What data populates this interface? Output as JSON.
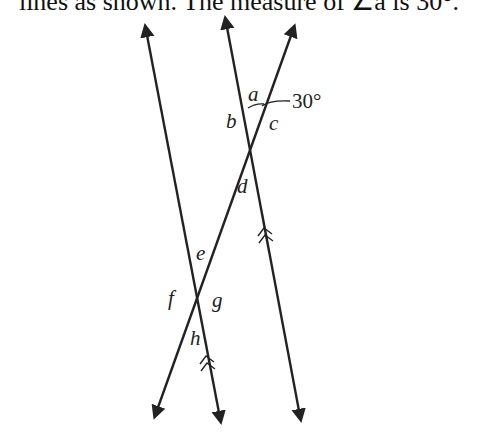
{
  "caption": "lines as shown.  The measure of ∠a is 30°.",
  "diagram": {
    "angle_given": "30°",
    "labels": {
      "a": "a",
      "b": "b",
      "c": "c",
      "d": "d",
      "e": "e",
      "f": "f",
      "g": "g",
      "h": "h"
    },
    "lines": [
      {
        "name": "parallel-line-left",
        "marker": "double-chevron"
      },
      {
        "name": "parallel-line-right",
        "marker": "double-chevron"
      },
      {
        "name": "transversal"
      }
    ],
    "colors": {
      "stroke": "#222222",
      "background": "#ffffff"
    }
  }
}
